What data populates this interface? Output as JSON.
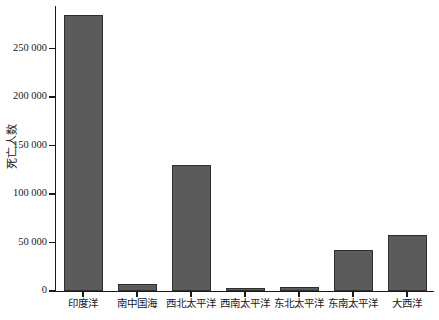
{
  "chart_data": {
    "type": "bar",
    "title": "",
    "xlabel": "",
    "ylabel": "死亡人数",
    "categories": [
      "印度洋",
      "南中国海",
      "西北太平洋",
      "西南太平洋",
      "东北太平洋",
      "东南太平洋",
      "大西洋"
    ],
    "values": [
      285000,
      7000,
      130000,
      3500,
      4500,
      42000,
      58000
    ],
    "ylim": [
      0,
      294000
    ],
    "yticks": [
      0,
      50000,
      100000,
      150000,
      200000,
      250000
    ],
    "ytick_labels": [
      "0",
      "50 000",
      "100 000",
      "150 000",
      "200 000",
      "250 000"
    ],
    "grid": false,
    "legend": false,
    "bar_color": "#5b5b5b",
    "bar_border_color": "#2e2e2e",
    "axis_color": "#1a1a1a",
    "background": "#ffffff"
  },
  "axis": {
    "y_title": "死亡人数"
  }
}
